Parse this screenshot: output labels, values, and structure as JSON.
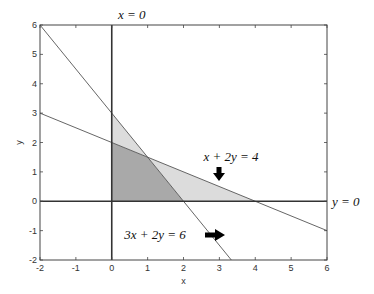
{
  "chart_data": {
    "type": "line",
    "title": "",
    "xlabel": "x",
    "ylabel": "y",
    "xlim": [
      -2,
      6
    ],
    "ylim": [
      -2,
      6
    ],
    "xticks": [
      -2,
      -1,
      0,
      1,
      2,
      3,
      4,
      5,
      6
    ],
    "yticks": [
      -2,
      -1,
      0,
      1,
      2,
      3,
      4,
      5,
      6
    ],
    "grid": false,
    "series": [
      {
        "name": "x + 2y = 4",
        "x": [
          -2,
          6
        ],
        "y": [
          3,
          -1
        ],
        "color": "#555555"
      },
      {
        "name": "3x + 2y = 6",
        "x": [
          -2,
          4
        ],
        "y": [
          6,
          -3
        ],
        "color": "#555555"
      },
      {
        "name": "x = 0",
        "x": [
          0,
          0
        ],
        "y": [
          -2,
          6
        ],
        "color": "#333333"
      },
      {
        "name": "y = 0",
        "x": [
          -2,
          6
        ],
        "y": [
          0,
          0
        ],
        "color": "#333333"
      }
    ],
    "regions": [
      {
        "name": "feasible-region",
        "vertices": [
          [
            0,
            0
          ],
          [
            0,
            2
          ],
          [
            1,
            1.5
          ],
          [
            2,
            0
          ]
        ],
        "fill": "#a9a9a9"
      },
      {
        "name": "upper-light-region",
        "vertices": [
          [
            0,
            2
          ],
          [
            0,
            3
          ],
          [
            1,
            1.5
          ]
        ],
        "fill": "#dcdcdc"
      },
      {
        "name": "lower-light-region",
        "vertices": [
          [
            1,
            1.5
          ],
          [
            2,
            0
          ],
          [
            4,
            0
          ]
        ],
        "fill": "#dcdcdc"
      }
    ],
    "annotations": [
      {
        "text": "x = 0",
        "x": 0,
        "y": 6.4
      },
      {
        "text": "y = 0",
        "x": 6.6,
        "y": 0
      },
      {
        "text": "x + 2y = 4",
        "x": 3,
        "y": 1.1,
        "arrow": "down"
      },
      {
        "text": "3x + 2y = 6",
        "x": 1.5,
        "y": -1,
        "arrow": "right"
      }
    ]
  }
}
